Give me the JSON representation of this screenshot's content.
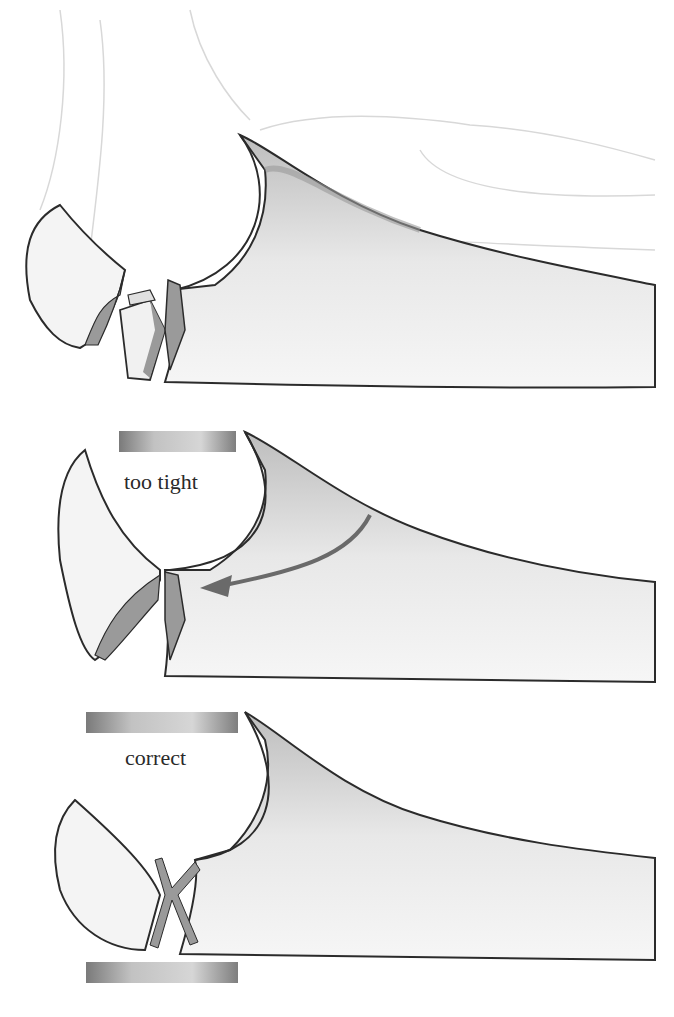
{
  "figure": {
    "panels": [
      {
        "id": "fracture",
        "label": ""
      },
      {
        "id": "too-tight",
        "label": "too tight"
      },
      {
        "id": "correct",
        "label": "correct"
      }
    ]
  },
  "colors": {
    "outline": "#2b2b2b",
    "fracture_fill": "#9a9a9a",
    "bone_shade": "#c8c8c8",
    "plate_dark": "#7a7a7a",
    "plate_light": "#d4d4d4",
    "arrow": "#6a6a6a"
  }
}
